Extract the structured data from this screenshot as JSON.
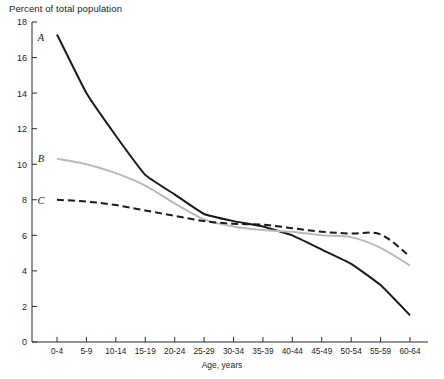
{
  "chart_data": {
    "type": "line",
    "title": "Percent of total population",
    "xlabel": "Age, years",
    "ylabel": "",
    "categories": [
      "0-4",
      "5-9",
      "10-14",
      "15-19",
      "20-24",
      "25-29",
      "30-34",
      "35-39",
      "40-44",
      "45-49",
      "50-54",
      "55-59",
      "60-64"
    ],
    "ylim": [
      0,
      18
    ],
    "y_ticks": [
      "0",
      "2",
      "4",
      "6",
      "8",
      "10",
      "12",
      "14",
      "16",
      "18"
    ],
    "grid": false,
    "legend_position": "inline-curve-labels",
    "series": [
      {
        "name": "A",
        "style": "solid",
        "color": "#1a1a1a",
        "width": 2.0,
        "values": [
          17.3,
          14.0,
          11.6,
          9.4,
          8.3,
          7.2,
          6.8,
          6.5,
          6.0,
          5.2,
          4.4,
          3.2,
          1.5
        ]
      },
      {
        "name": "B",
        "style": "solid",
        "color": "#b9b9b9",
        "width": 2.0,
        "values": [
          10.3,
          10.0,
          9.5,
          8.8,
          7.8,
          6.9,
          6.5,
          6.3,
          6.2,
          6.0,
          5.9,
          5.3,
          4.3
        ]
      },
      {
        "name": "C",
        "style": "dashed",
        "color": "#1a1a1a",
        "width": 2.0,
        "values": [
          8.0,
          7.9,
          7.7,
          7.4,
          7.1,
          6.8,
          6.65,
          6.6,
          6.4,
          6.2,
          6.1,
          6.05,
          4.8
        ]
      }
    ],
    "series_labels": [
      {
        "name": "A",
        "x_px": 41,
        "y_px": 41
      },
      {
        "name": "B",
        "x_px": 41,
        "y_px": 162
      },
      {
        "name": "C",
        "x_px": 41,
        "y_px": 204
      }
    ]
  },
  "colors": {
    "series_a": "#1a1a1a",
    "series_b": "#b9b9b9",
    "series_c": "#1a1a1a",
    "axis": "#2b2b2b",
    "background": "#ffffff"
  }
}
